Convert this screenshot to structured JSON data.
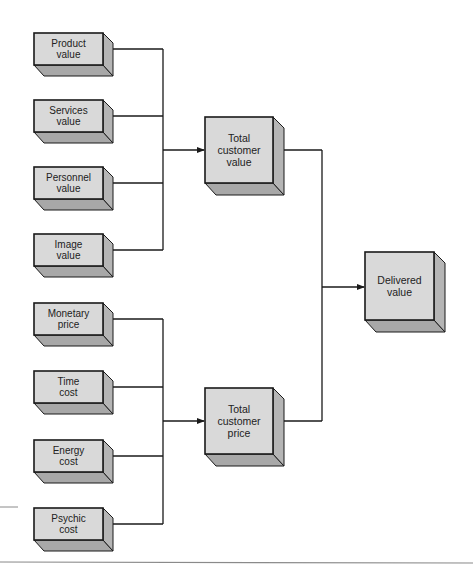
{
  "diagram": {
    "colors": {
      "front": "#d9d9d9",
      "side": "#b5b5b5",
      "bottom": "#a8a8a8",
      "stroke": "#1a1a1a",
      "rule": "#8a8a8a"
    },
    "value_inputs": [
      {
        "id": "product-value",
        "label": "Product\nvalue",
        "y": 33
      },
      {
        "id": "services-value",
        "label": "Services\nvalue",
        "y": 100
      },
      {
        "id": "personnel-value",
        "label": "Personnel\nvalue",
        "y": 167
      },
      {
        "id": "image-value",
        "label": "Image\nvalue",
        "y": 234
      }
    ],
    "cost_inputs": [
      {
        "id": "monetary-price",
        "label": "Monetary\nprice",
        "y": 303
      },
      {
        "id": "time-cost",
        "label": "Time\ncost",
        "y": 371
      },
      {
        "id": "energy-cost",
        "label": "Energy\ncost",
        "y": 440
      },
      {
        "id": "psychic-cost",
        "label": "Psychic\ncost",
        "y": 508
      }
    ],
    "totals": [
      {
        "id": "total-customer-value",
        "label": "Total\ncustomer\nvalue",
        "y": 117
      },
      {
        "id": "total-customer-price",
        "label": "Total\ncustomer\nprice",
        "y": 388
      }
    ],
    "result": {
      "id": "delivered-value",
      "label": "Delivered\nvalue",
      "y": 252
    }
  }
}
